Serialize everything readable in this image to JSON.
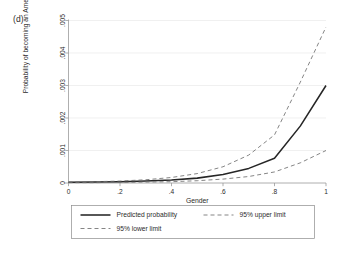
{
  "panel": {
    "label": "(d)"
  },
  "chart_data": {
    "type": "line",
    "title": "",
    "subtitle": "",
    "xlabel": "Gender",
    "ylabel": "Probability of becoming an American jihadist",
    "xlim": [
      0,
      1
    ],
    "ylim": [
      0,
      0.005
    ],
    "xticks": [
      0,
      0.2,
      0.4,
      0.6,
      0.8,
      1
    ],
    "xtick_labels": [
      "0",
      ".2",
      ".4",
      ".6",
      ".8",
      "1"
    ],
    "yticks": [
      0,
      0.001,
      0.002,
      0.003,
      0.004,
      0.005
    ],
    "ytick_labels": [
      "0",
      ".001",
      ".002",
      ".003",
      ".004",
      ".005"
    ],
    "grid": true,
    "grid_axis": "y",
    "legend_position": "bottom-outside",
    "x": [
      0,
      0.1,
      0.2,
      0.3,
      0.4,
      0.5,
      0.6,
      0.7,
      0.8,
      0.9,
      1
    ],
    "series": [
      {
        "name": "Predicted probability",
        "style": "solid",
        "color": "#262626",
        "values": [
          2e-05,
          3e-05,
          4e-05,
          6e-05,
          9e-05,
          0.00015,
          0.00026,
          0.00045,
          0.00076,
          0.00175,
          0.003
        ]
      },
      {
        "name": "95% upper limit",
        "style": "dashed",
        "color": "#6f6f6f",
        "values": [
          3e-05,
          4e-05,
          6e-05,
          0.0001,
          0.00017,
          0.00029,
          0.0005,
          0.00086,
          0.00148,
          0.0031,
          0.0048
        ]
      },
      {
        "name": "95% lower limit",
        "style": "dashed",
        "color": "#6f6f6f",
        "values": [
          1e-05,
          1e-05,
          2e-05,
          3e-05,
          4e-05,
          7e-05,
          0.00012,
          0.0002,
          0.00034,
          0.00062,
          0.001
        ]
      }
    ]
  },
  "legend": {
    "entries": [
      {
        "label": "Predicted probability",
        "style": "solid"
      },
      {
        "label": "95% upper limit",
        "style": "dashed"
      },
      {
        "label": "95% lower limit",
        "style": "dashed"
      }
    ]
  }
}
